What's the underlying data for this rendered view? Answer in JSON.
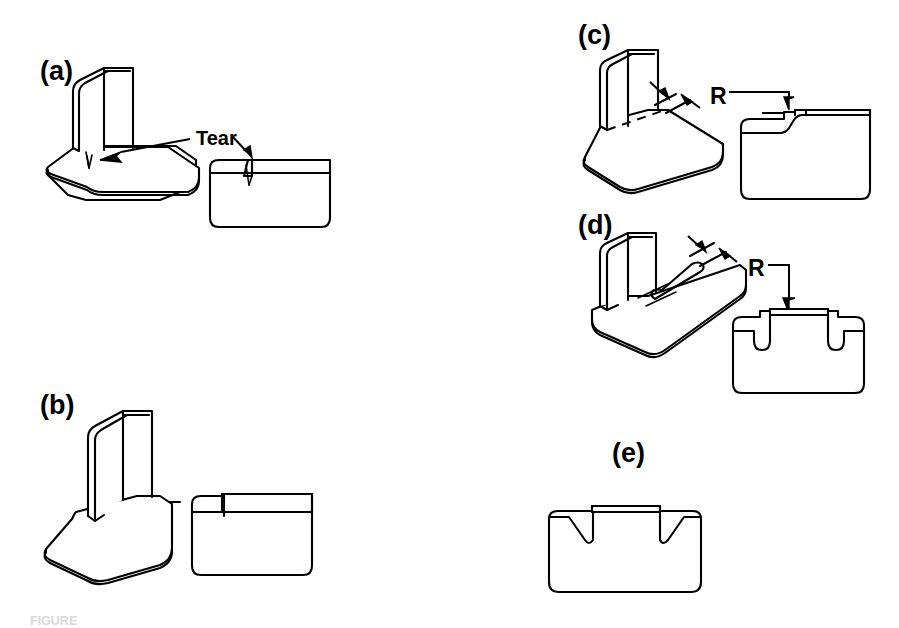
{
  "figure": {
    "type": "engineering-line-drawing",
    "background_color": "#ffffff",
    "line_color": "#000000",
    "caption": "FIGURE"
  },
  "panels": [
    {
      "id": "a",
      "label": "(a)",
      "label_x": 40,
      "label_y": 58,
      "description": "Bent flange without relief showing a tear at the bend",
      "views": [
        "isometric",
        "flat-pattern"
      ],
      "annotations": [
        {
          "text": "Tear",
          "x": 196,
          "y": 128,
          "kind": "callout-label"
        }
      ],
      "arrows": 2,
      "relief": "none",
      "flat_feature": "v-notch-tear"
    },
    {
      "id": "b",
      "label": "(b)",
      "label_x": 40,
      "label_y": 392,
      "description": "Bent flange with square tab, no relief cut",
      "views": [
        "isometric",
        "flat-pattern"
      ],
      "annotations": [],
      "arrows": 0,
      "relief": "none",
      "flat_feature": "plain-tab"
    },
    {
      "id": "c",
      "label": "(c)",
      "label_x": 578,
      "label_y": 22,
      "description": "Bend relief of width R at one end of the bend, stepped flat pattern",
      "views": [
        "isometric",
        "flat-pattern"
      ],
      "annotations": [
        {
          "text": "R",
          "x": 710,
          "y": 85,
          "kind": "dimension-label"
        }
      ],
      "arrows": 4,
      "relief": "single-edge-relief",
      "flat_feature": "single-step"
    },
    {
      "id": "d",
      "label": "(d)",
      "label_x": 578,
      "label_y": 212,
      "description": "Slot relief of width R along the bend line, flat pattern with two round-bottom notches",
      "views": [
        "isometric",
        "flat-pattern"
      ],
      "annotations": [
        {
          "text": "R",
          "x": 748,
          "y": 257,
          "kind": "dimension-label"
        }
      ],
      "arrows": 4,
      "relief": "slot-relief",
      "flat_feature": "two-u-notches"
    },
    {
      "id": "e",
      "label": "(e)",
      "label_x": 612,
      "label_y": 440,
      "description": "Flat pattern with wide chamfered V-shaped reliefs",
      "views": [
        "flat-pattern"
      ],
      "annotations": [],
      "arrows": 0,
      "relief": "chamfer-relief",
      "flat_feature": "two-v-notches"
    }
  ]
}
